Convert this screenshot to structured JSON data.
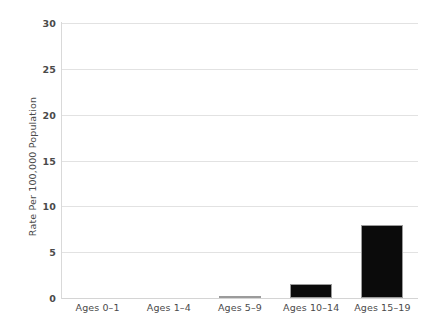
{
  "chart_data": {
    "type": "bar",
    "title": "",
    "xlabel": "",
    "ylabel": "Rate Per 100,000 Population",
    "categories": [
      "Ages 0–1",
      "Ages 1–4",
      "Ages 5–9",
      "Ages 10–14",
      "Ages 15–19"
    ],
    "values": [
      0,
      0,
      0.2,
      1.5,
      8
    ],
    "ylim": [
      0,
      30
    ],
    "yticks": [
      0,
      5,
      10,
      15,
      20,
      25,
      30
    ],
    "ytick_labels": [
      "0",
      "5",
      "10",
      "15",
      "20",
      "25",
      "30"
    ],
    "grid": true,
    "legend": false,
    "bar_color": "#0b0b0b",
    "bar_border_color": "#9b9b9b",
    "gridline_color": "#e2e2e2",
    "axis_color": "#d9d9d9",
    "text_color": "#4a4a4a",
    "background_color": "#ffffff"
  }
}
